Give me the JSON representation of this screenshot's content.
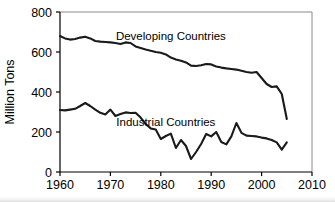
{
  "chart_data": {
    "type": "line",
    "title": "",
    "xlabel": "",
    "ylabel": "Million Tons",
    "xlim": [
      1960,
      2010
    ],
    "ylim": [
      0,
      800
    ],
    "xticks": [
      1960,
      1970,
      1980,
      1990,
      2000,
      2010
    ],
    "yticks": [
      0,
      200,
      400,
      600,
      800
    ],
    "xtick_labels": [
      "1960",
      "1970",
      "1980",
      "1990",
      "2000",
      "2010"
    ],
    "ytick_labels": [
      "0",
      "200",
      "400",
      "600",
      "800"
    ],
    "grid": false,
    "legend": "inline-annotations",
    "x": [
      1960,
      1961,
      1962,
      1963,
      1964,
      1965,
      1966,
      1967,
      1968,
      1969,
      1970,
      1971,
      1972,
      1973,
      1974,
      1975,
      1976,
      1977,
      1978,
      1979,
      1980,
      1981,
      1982,
      1983,
      1984,
      1985,
      1986,
      1987,
      1988,
      1989,
      1990,
      1991,
      1992,
      1993,
      1994,
      1995,
      1996,
      1997,
      1998,
      1999,
      2000,
      2001,
      2002,
      2003,
      2004,
      2005
    ],
    "series": [
      {
        "name": "Developing Countries",
        "label_x": 1982,
        "label_y": 660,
        "values": [
          680,
          668,
          662,
          665,
          672,
          676,
          668,
          655,
          652,
          650,
          648,
          645,
          640,
          648,
          645,
          628,
          620,
          612,
          606,
          600,
          596,
          588,
          572,
          562,
          556,
          548,
          532,
          530,
          534,
          540,
          538,
          528,
          522,
          518,
          515,
          512,
          506,
          500,
          496,
          500,
          470,
          440,
          425,
          428,
          390,
          265
        ]
      },
      {
        "name": "Industrial Countries",
        "label_x": 1981,
        "label_y": 228,
        "values": [
          310,
          308,
          312,
          316,
          330,
          345,
          330,
          312,
          296,
          288,
          312,
          280,
          290,
          298,
          295,
          296,
          272,
          240,
          218,
          212,
          165,
          180,
          192,
          120,
          160,
          130,
          65,
          100,
          140,
          190,
          178,
          200,
          150,
          138,
          178,
          245,
          196,
          182,
          180,
          178,
          172,
          168,
          160,
          148,
          112,
          148
        ]
      }
    ]
  }
}
